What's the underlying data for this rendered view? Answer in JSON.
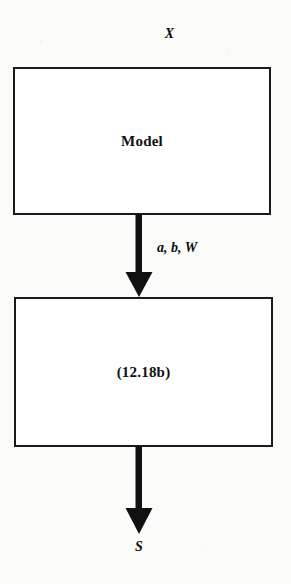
{
  "diagram": {
    "title_label": "X",
    "output_label": "S",
    "nodes": [
      {
        "id": "model",
        "label": "Model",
        "shape": "rectangle"
      },
      {
        "id": "equation",
        "label": "(12.18b)",
        "shape": "rectangle"
      }
    ],
    "edges": [
      {
        "id": "model-to-equation",
        "from": "model",
        "to": "equation",
        "label": "a, b, W",
        "direction": "down"
      },
      {
        "id": "equation-to-output",
        "from": "equation",
        "to": "output",
        "label": "",
        "direction": "down"
      }
    ],
    "colors": {
      "stroke": "#1a1a1a",
      "fill": "#ffffff",
      "text": "#0d0d0d",
      "background": "#fbfbfa"
    }
  }
}
